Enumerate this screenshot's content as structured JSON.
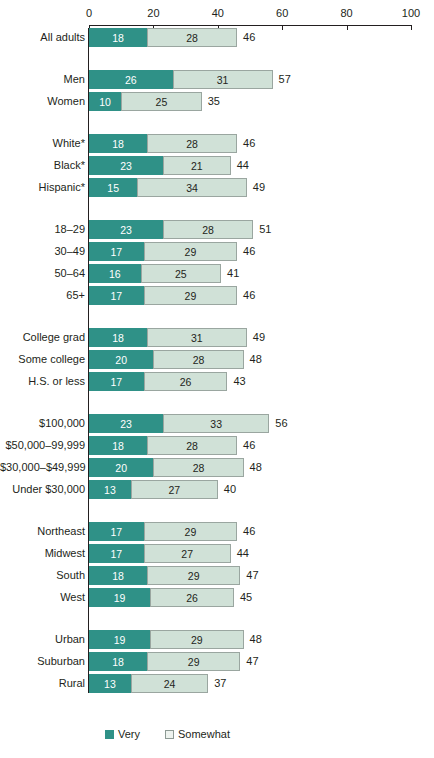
{
  "chart_data": {
    "type": "bar",
    "orientation": "horizontal",
    "stacked": true,
    "title": "",
    "xlabel": "",
    "ylabel": "",
    "xlim": [
      0,
      100
    ],
    "xticks": [
      0,
      20,
      40,
      60,
      80,
      100
    ],
    "grid": false,
    "legend_position": "bottom",
    "series": [
      {
        "name": "Very",
        "color": "#2f9187"
      },
      {
        "name": "Somewhat",
        "color": "#d0e1d7"
      }
    ],
    "groups": [
      {
        "name": "all",
        "rows": [
          {
            "label": "All adults",
            "very": 18,
            "somewhat": 28,
            "total": 46
          }
        ]
      },
      {
        "name": "gender",
        "rows": [
          {
            "label": "Men",
            "very": 26,
            "somewhat": 31,
            "total": 57
          },
          {
            "label": "Women",
            "very": 10,
            "somewhat": 25,
            "total": 35
          }
        ]
      },
      {
        "name": "race",
        "rows": [
          {
            "label": "White*",
            "very": 18,
            "somewhat": 28,
            "total": 46
          },
          {
            "label": "Black*",
            "very": 23,
            "somewhat": 21,
            "total": 44
          },
          {
            "label": "Hispanic*",
            "very": 15,
            "somewhat": 34,
            "total": 49
          }
        ]
      },
      {
        "name": "age",
        "rows": [
          {
            "label": "18–29",
            "very": 23,
            "somewhat": 28,
            "total": 51
          },
          {
            "label": "30–49",
            "very": 17,
            "somewhat": 29,
            "total": 46
          },
          {
            "label": "50–64",
            "very": 16,
            "somewhat": 25,
            "total": 41
          },
          {
            "label": "65+",
            "very": 17,
            "somewhat": 29,
            "total": 46
          }
        ]
      },
      {
        "name": "education",
        "rows": [
          {
            "label": "College grad",
            "very": 18,
            "somewhat": 31,
            "total": 49
          },
          {
            "label": "Some college",
            "very": 20,
            "somewhat": 28,
            "total": 48
          },
          {
            "label": "H.S. or less",
            "very": 17,
            "somewhat": 26,
            "total": 43
          }
        ]
      },
      {
        "name": "income",
        "rows": [
          {
            "label": "$100,000",
            "very": 23,
            "somewhat": 33,
            "total": 56
          },
          {
            "label": "$50,000–99,999",
            "very": 18,
            "somewhat": 28,
            "total": 46
          },
          {
            "label": "$30,000–$49,999",
            "very": 20,
            "somewhat": 28,
            "total": 48
          },
          {
            "label": "Under $30,000",
            "very": 13,
            "somewhat": 27,
            "total": 40
          }
        ]
      },
      {
        "name": "region",
        "rows": [
          {
            "label": "Northeast",
            "very": 17,
            "somewhat": 29,
            "total": 46
          },
          {
            "label": "Midwest",
            "very": 17,
            "somewhat": 27,
            "total": 44
          },
          {
            "label": "South",
            "very": 18,
            "somewhat": 29,
            "total": 47
          },
          {
            "label": "West",
            "very": 19,
            "somewhat": 26,
            "total": 45
          }
        ]
      },
      {
        "name": "community",
        "rows": [
          {
            "label": "Urban",
            "very": 19,
            "somewhat": 29,
            "total": 48
          },
          {
            "label": "Suburban",
            "very": 18,
            "somewhat": 29,
            "total": 47
          },
          {
            "label": "Rural",
            "very": 13,
            "somewhat": 24,
            "total": 37
          }
        ]
      }
    ],
    "legend": [
      {
        "label": "Very",
        "swatch": "very"
      },
      {
        "label": "Somewhat",
        "swatch": "somewhat"
      }
    ]
  },
  "colors": {
    "very": "#2f9187",
    "somewhat": "#d0e1d7",
    "text": "#231f20",
    "somewhat_border": "#9aa6a0"
  }
}
